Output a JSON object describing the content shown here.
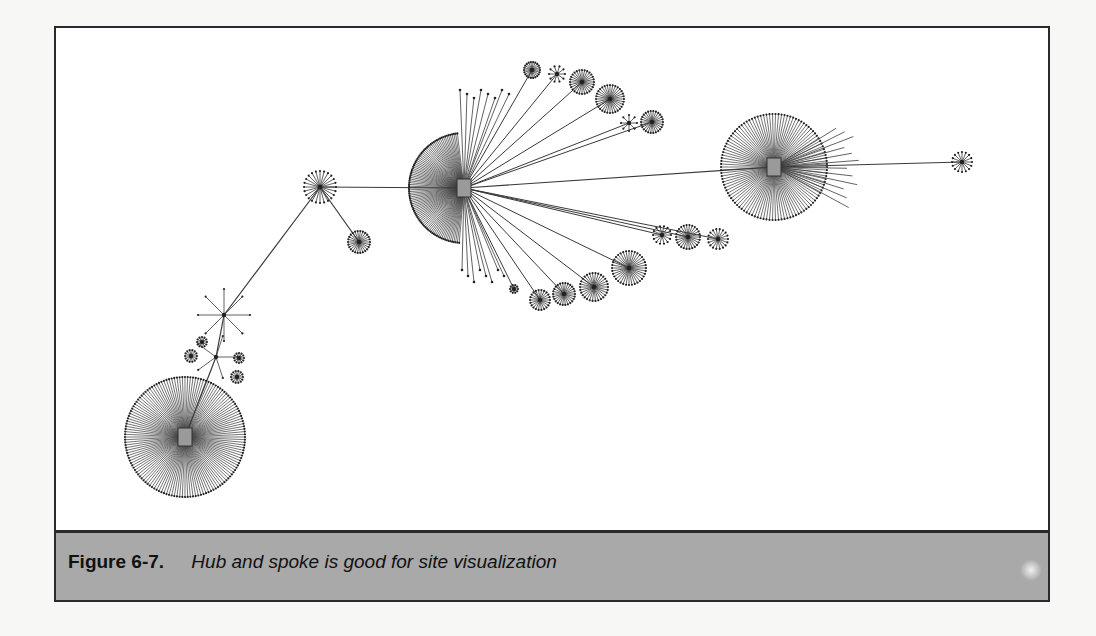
{
  "figure": {
    "label": "Figure 6-7.",
    "title": "Hub and spoke is good for site visualization"
  },
  "diagram": {
    "type": "hub-and-spoke network",
    "colors": {
      "line": "#3a3a3a",
      "node": "#222222",
      "hub_icon": "#9a9a9a",
      "caption_bg": "#a9a9a9"
    },
    "hubs": [
      {
        "id": "hub-left",
        "x": 183,
        "y": 435,
        "radius": 60,
        "spokes": 140
      },
      {
        "id": "hub-center",
        "x": 462,
        "y": 186,
        "radius": 55,
        "spokes": 90,
        "arc": [
          95,
          265
        ]
      },
      {
        "id": "hub-right",
        "x": 772,
        "y": 165,
        "radius": 53,
        "spokes": 110
      }
    ],
    "clusters": [
      {
        "x": 318,
        "y": 185,
        "r": 16,
        "n": 24
      },
      {
        "x": 357,
        "y": 240,
        "r": 11,
        "n": 26
      },
      {
        "x": 222,
        "y": 313,
        "r": 26,
        "n": 8
      },
      {
        "x": 214,
        "y": 355,
        "r": 22,
        "n": 5
      },
      {
        "x": 189,
        "y": 354,
        "r": 6,
        "n": 14
      },
      {
        "x": 200,
        "y": 340,
        "r": 5,
        "n": 12
      },
      {
        "x": 235,
        "y": 375,
        "r": 6,
        "n": 14
      },
      {
        "x": 237,
        "y": 356,
        "r": 5,
        "n": 12
      },
      {
        "x": 530,
        "y": 68,
        "r": 8,
        "n": 22
      },
      {
        "x": 555,
        "y": 72,
        "r": 8,
        "n": 10
      },
      {
        "x": 580,
        "y": 80,
        "r": 12,
        "n": 28
      },
      {
        "x": 608,
        "y": 97,
        "r": 14,
        "n": 32
      },
      {
        "x": 627,
        "y": 121,
        "r": 8,
        "n": 8
      },
      {
        "x": 650,
        "y": 120,
        "r": 11,
        "n": 26
      },
      {
        "x": 660,
        "y": 233,
        "r": 9,
        "n": 14
      },
      {
        "x": 686,
        "y": 235,
        "r": 12,
        "n": 26
      },
      {
        "x": 716,
        "y": 237,
        "r": 10,
        "n": 18
      },
      {
        "x": 627,
        "y": 266,
        "r": 17,
        "n": 36
      },
      {
        "x": 592,
        "y": 285,
        "r": 14,
        "n": 30
      },
      {
        "x": 562,
        "y": 292,
        "r": 11,
        "n": 26
      },
      {
        "x": 538,
        "y": 298,
        "r": 10,
        "n": 22
      },
      {
        "x": 512,
        "y": 287,
        "r": 4,
        "n": 10
      },
      {
        "x": 960,
        "y": 160,
        "r": 10,
        "n": 16
      }
    ],
    "edges": [
      [
        "hub-center",
        318,
        185
      ],
      [
        318,
        185,
        357,
        240
      ],
      [
        318,
        185,
        222,
        313
      ],
      [
        222,
        313,
        214,
        355
      ],
      [
        214,
        355,
        183,
        435
      ],
      [
        "hub-center",
        "hub-right"
      ],
      [
        "hub-right",
        960,
        160
      ]
    ]
  }
}
